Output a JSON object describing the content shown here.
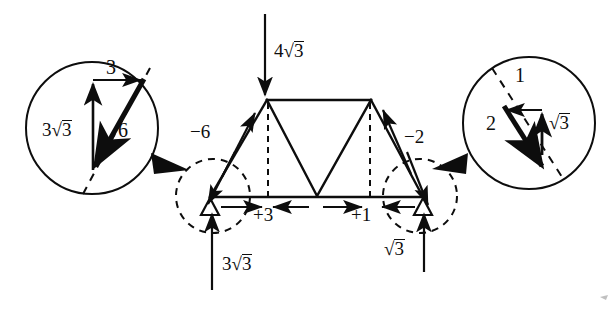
{
  "figure": {
    "type": "truss-force-diagram"
  },
  "applied_load": {
    "label_num": "4",
    "label_radicand": "3",
    "direction": "down",
    "node": "left-apex"
  },
  "reactions": [
    {
      "id": "left",
      "label_num": "3",
      "label_radicand": "3",
      "direction": "up"
    },
    {
      "id": "right",
      "label_num": "",
      "label_radicand": "3",
      "direction": "up"
    }
  ],
  "member_forces": [
    {
      "id": "left-diagonal",
      "label": "−6",
      "sense": "compression"
    },
    {
      "id": "right-diagonal",
      "label": "−2",
      "sense": "compression"
    },
    {
      "id": "bottom-left",
      "label": "+3",
      "sense": "tension"
    },
    {
      "id": "bottom-right",
      "label": "+1",
      "sense": "tension"
    }
  ],
  "detail_left": {
    "name": "left-joint-force-polygon",
    "vertical_label_num": "3",
    "vertical_label_radicand": "3",
    "horizontal_label": "3",
    "resultant_label": "6"
  },
  "detail_right": {
    "name": "right-joint-force-polygon",
    "horizontal_label": "1",
    "vertical_label_radicand": "3",
    "resultant_label": "2"
  },
  "colors": {
    "ink": "#0d0d0d",
    "background": "#ffffff"
  }
}
